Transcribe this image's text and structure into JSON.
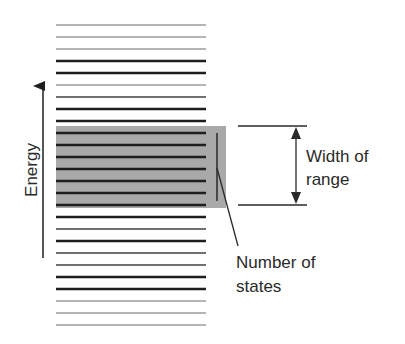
{
  "diagram": {
    "axis_label": "Energy",
    "width_label_line1": "Width of",
    "width_label_line2": "range",
    "states_label_line1": "Number of",
    "states_label_line2": "states",
    "colors": {
      "dark": "#1e1e1e",
      "medium": "#707070",
      "light": "#b4b4b4",
      "highlight_box": "#a9a9a9",
      "annotation": "#2a2a2a"
    },
    "levels": {
      "x_start": 56,
      "x_end": 206,
      "y_positions": [
        25,
        37,
        49,
        61,
        73,
        85,
        97,
        109,
        121,
        133,
        145,
        157,
        169,
        181,
        193,
        205,
        217,
        229,
        241,
        253,
        265,
        277,
        289,
        301,
        313,
        325
      ],
      "shades": [
        "light",
        "light",
        "light",
        "dark",
        "dark",
        "light",
        "medium",
        "dark",
        "dark",
        "dark",
        "dark",
        "dark",
        "dark",
        "dark",
        "dark",
        "dark",
        "dark",
        "medium",
        "dark",
        "medium",
        "medium",
        "dark",
        "dark",
        "light",
        "light",
        "light"
      ]
    },
    "highlight_range": {
      "y_top": 126,
      "y_bottom": 208,
      "x_left": 56,
      "x_right": 226
    }
  }
}
